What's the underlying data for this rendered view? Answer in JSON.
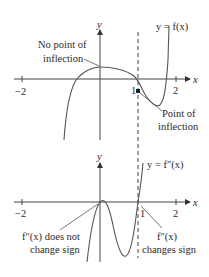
{
  "top_plot": {
    "y_axis_label": "y",
    "x_axis_label": "x",
    "curve_label": "y = f(x)",
    "ticks": {
      "neg2": "−2",
      "one": "1",
      "two": "2"
    },
    "annotation_left_line1": "No point of",
    "annotation_left_line2": "inflection",
    "annotation_right_line1": "Point of",
    "annotation_right_line2": "inflection"
  },
  "bottom_plot": {
    "y_axis_label": "y",
    "x_axis_label": "x",
    "curve_label": "y = f″(x)",
    "ticks": {
      "neg2": "−2",
      "one": "1",
      "two": "2"
    },
    "annotation_left_line1": "f″(x) does not",
    "annotation_left_line2": "change sign",
    "annotation_right_line1": "f″(x)",
    "annotation_right_line2": "changes sign"
  },
  "dashed_line_x": 1
}
